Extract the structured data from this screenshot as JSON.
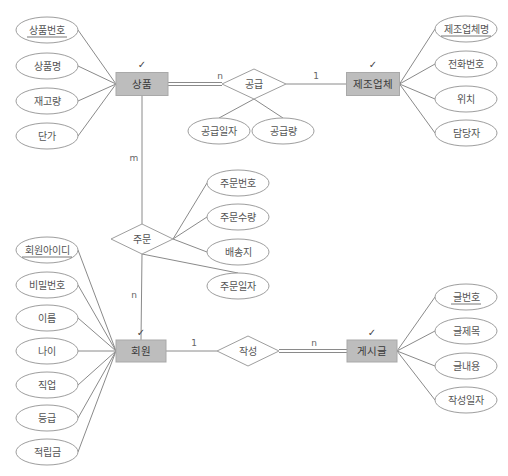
{
  "diagram": {
    "type": "ER diagram",
    "entities": [
      {
        "id": "product",
        "label": "상품",
        "check": "✓",
        "cx": 142,
        "cy": 84,
        "w": 52,
        "h": 23,
        "attributes": [
          {
            "label": "상품번호",
            "key": true,
            "cx": 47,
            "cy": 30
          },
          {
            "label": "상품명",
            "key": false,
            "cx": 47,
            "cy": 66
          },
          {
            "label": "재고량",
            "key": false,
            "cx": 47,
            "cy": 101
          },
          {
            "label": "단가",
            "key": false,
            "cx": 47,
            "cy": 136
          }
        ]
      },
      {
        "id": "manufacturer",
        "label": "제조업체",
        "check": "✓",
        "cx": 373,
        "cy": 84,
        "w": 53,
        "h": 23,
        "attributes": [
          {
            "label": "제조업체명",
            "key": true,
            "cx": 466,
            "cy": 29
          },
          {
            "label": "전화번호",
            "key": false,
            "cx": 466,
            "cy": 64
          },
          {
            "label": "위치",
            "key": false,
            "cx": 466,
            "cy": 99
          },
          {
            "label": "담당자",
            "key": false,
            "cx": 466,
            "cy": 133
          }
        ]
      },
      {
        "id": "member",
        "label": "회원",
        "check": "✓",
        "cx": 141,
        "cy": 351,
        "w": 50,
        "h": 22,
        "attributes": [
          {
            "label": "회원아이디",
            "key": true,
            "cx": 47,
            "cy": 250
          },
          {
            "label": "비밀번호",
            "key": false,
            "cx": 47,
            "cy": 285
          },
          {
            "label": "이름",
            "key": false,
            "cx": 47,
            "cy": 318
          },
          {
            "label": "나이",
            "key": false,
            "cx": 47,
            "cy": 351
          },
          {
            "label": "직업",
            "key": false,
            "cx": 47,
            "cy": 385
          },
          {
            "label": "등급",
            "key": false,
            "cx": 47,
            "cy": 418
          },
          {
            "label": "적립금",
            "key": false,
            "cx": 47,
            "cy": 452
          }
        ]
      },
      {
        "id": "post",
        "label": "게시글",
        "check": "✓",
        "cx": 372,
        "cy": 351,
        "w": 50,
        "h": 22,
        "attributes": [
          {
            "label": "글번호",
            "key": true,
            "cx": 466,
            "cy": 297
          },
          {
            "label": "글제목",
            "key": false,
            "cx": 466,
            "cy": 331
          },
          {
            "label": "글내용",
            "key": false,
            "cx": 466,
            "cy": 366
          },
          {
            "label": "작성일자",
            "key": false,
            "cx": 466,
            "cy": 400
          }
        ]
      }
    ],
    "relationships": [
      {
        "id": "supply",
        "label": "공급",
        "cx": 254,
        "cy": 84,
        "w": 64,
        "h": 30,
        "attributes": [
          {
            "label": "공급일자",
            "cx": 219,
            "cy": 131
          },
          {
            "label": "공급량",
            "cx": 283,
            "cy": 131
          }
        ]
      },
      {
        "id": "order",
        "label": "주문",
        "cx": 142,
        "cy": 239,
        "w": 62,
        "h": 30,
        "attributes": [
          {
            "label": "주문번호",
            "cx": 238,
            "cy": 183
          },
          {
            "label": "주문수량",
            "cx": 238,
            "cy": 217
          },
          {
            "label": "배송지",
            "cx": 238,
            "cy": 252
          },
          {
            "label": "주문일자",
            "cx": 238,
            "cy": 286
          }
        ]
      },
      {
        "id": "write",
        "label": "작성",
        "cx": 248,
        "cy": 351,
        "w": 62,
        "h": 30,
        "attributes": []
      }
    ],
    "cardinalities": [
      {
        "label": "n",
        "x": 220,
        "y": 76,
        "between": "상품-공급"
      },
      {
        "label": "1",
        "x": 316,
        "y": 76,
        "between": "공급-제조업체"
      },
      {
        "label": "m",
        "x": 134,
        "y": 158,
        "between": "상품-주문"
      },
      {
        "label": "n",
        "x": 134,
        "y": 295,
        "between": "주문-회원"
      },
      {
        "label": "1",
        "x": 194,
        "y": 343,
        "between": "회원-작성"
      },
      {
        "label": "n",
        "x": 314,
        "y": 343,
        "between": "작성-게시글"
      }
    ]
  }
}
